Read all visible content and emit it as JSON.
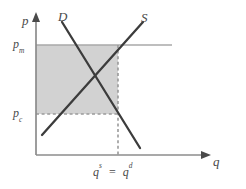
{
  "figure": {
    "type": "supply-demand-diagram",
    "axis_y_label": "p",
    "axis_x_label": "q",
    "curve_demand_label": "D",
    "curve_supply_label": "S",
    "price_monopoly": {
      "base": "p",
      "sub": "m"
    },
    "price_competitive": {
      "base": "p",
      "sub": "c"
    },
    "quantity_supplied": {
      "base": "q",
      "sup": "s"
    },
    "quantity_demanded": {
      "base": "q",
      "sup": "d"
    },
    "equality_sign": "=",
    "colors": {
      "shaded_region": "#d2d2d2",
      "curve_stroke": "#3c3c3c",
      "axis_stroke": "#8c8c8c",
      "price_line_stroke": "#a8a8a8",
      "dashed_stroke": "#9a9a9a",
      "label_text": "#4a4a4a",
      "background": "#ffffff"
    },
    "geometry": {
      "y_axis_x": 36,
      "x_axis_y": 155,
      "pm_y": 45,
      "pc_y": 114,
      "equilibrium_x": 118,
      "pm_line_end_x": 172,
      "demand_from": [
        62,
        22
      ],
      "demand_to": [
        140,
        148
      ],
      "supply_from": [
        42,
        135
      ],
      "supply_to": [
        143,
        22
      ]
    }
  }
}
